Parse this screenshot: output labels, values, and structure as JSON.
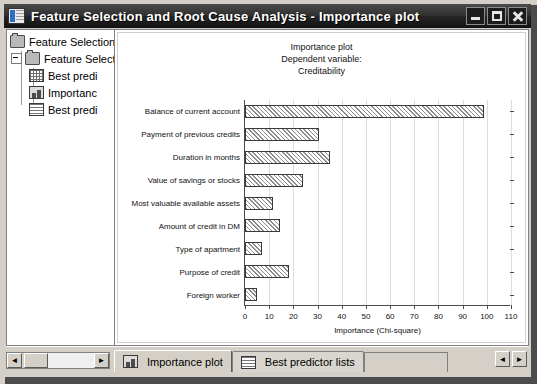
{
  "window": {
    "title": "Feature Selection and Root Cause Analysis - Importance plot",
    "icon": "statistica-workbook-icon",
    "controls": {
      "minimize": "_",
      "maximize": "□",
      "close": "✕"
    }
  },
  "tree": {
    "items": [
      {
        "label": "Feature Selection",
        "icon": "folder-icon",
        "level": 0
      },
      {
        "label": "Feature Select",
        "icon": "folder-icon",
        "level": 1
      },
      {
        "label": "Best predi",
        "icon": "spreadsheet-icon",
        "level": 2
      },
      {
        "label": "Importanc",
        "icon": "chart-icon",
        "level": 2
      },
      {
        "label": "Best predi",
        "icon": "report-icon",
        "level": 2
      }
    ],
    "scrollbar": {
      "left_arrow": "◄",
      "right_arrow": "►"
    }
  },
  "chart_data": {
    "type": "bar",
    "orientation": "horizontal",
    "title": "Importance plot",
    "subtitle": "Dependent variable:",
    "subtitle2": "Creditability",
    "xlabel": "Importance (Chi-square)",
    "ylabel": "",
    "xlim": [
      0,
      110
    ],
    "xticks": [
      0,
      10,
      20,
      30,
      40,
      50,
      60,
      70,
      80,
      90,
      100,
      110
    ],
    "grid": true,
    "legend": "none",
    "categories": [
      "Balance of current account",
      "Payment of previous credits",
      "Duration in months",
      "Value of savings or stocks",
      "Most valuable available assets",
      "Amount of credit in DM",
      "Type of apartment",
      "Purpose of credit",
      "Foreign worker"
    ],
    "values": [
      99.0,
      30.7,
      35.3,
      24.0,
      11.7,
      14.5,
      7.0,
      18.0,
      5.0
    ]
  },
  "tabs": [
    {
      "label": "Importance plot",
      "icon": "chart-icon",
      "active": true
    },
    {
      "label": "Best predictor lists",
      "icon": "report-icon",
      "active": false
    }
  ],
  "nav": {
    "prev": "◄",
    "next": "►"
  }
}
